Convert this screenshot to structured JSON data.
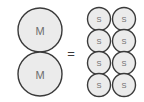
{
  "diagram": {
    "type": "equivalence",
    "relation_symbol": "=",
    "colors": {
      "circle_fill": "#ebebeb",
      "circle_stroke": "#3a3a3a",
      "label_text": "#6e6e6e",
      "equals_text": "#3a3a3a",
      "background": "#ffffff"
    },
    "left_group": {
      "name": "M-circles",
      "count": 2,
      "radius": 22,
      "label": "M",
      "circles": [
        {
          "label": "M",
          "cx": 40,
          "cy": 30
        },
        {
          "label": "M",
          "cx": 40,
          "cy": 74
        }
      ]
    },
    "right_group": {
      "name": "S-circles",
      "count": 8,
      "radius": 11.5,
      "label": "S",
      "columns": 2,
      "rows": 4,
      "circles": [
        {
          "label": "S",
          "cx": 99,
          "cy": 19
        },
        {
          "label": "S",
          "cx": 124,
          "cy": 19
        },
        {
          "label": "S",
          "cx": 99,
          "cy": 41
        },
        {
          "label": "S",
          "cx": 124,
          "cy": 41
        },
        {
          "label": "S",
          "cx": 99,
          "cy": 63
        },
        {
          "label": "S",
          "cx": 124,
          "cy": 63
        },
        {
          "label": "S",
          "cx": 99,
          "cy": 85
        },
        {
          "label": "S",
          "cx": 124,
          "cy": 85
        }
      ]
    },
    "equals": {
      "symbol": "=",
      "x": 71,
      "y": 53
    }
  }
}
